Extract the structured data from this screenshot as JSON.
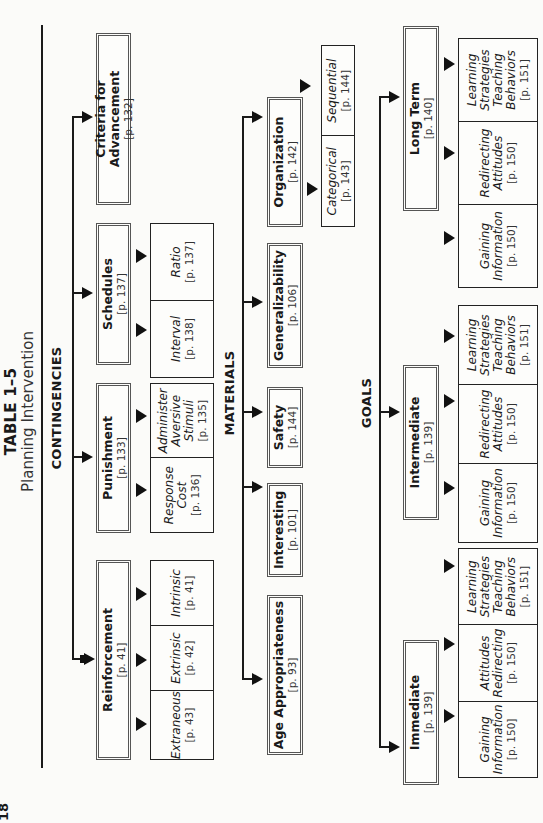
{
  "page_number": "18",
  "title": {
    "number": "TABLE 1–5",
    "subtitle": "Planning Intervention"
  },
  "sections": {
    "contingencies": {
      "heading": "CONTINGENCIES",
      "items": [
        {
          "label": "Reinforcement",
          "page": "[p. 41]",
          "subs": [
            {
              "label": "Intrinsic",
              "page": "[p. 41]"
            },
            {
              "label": "Extrinsic",
              "page": "[p. 42]"
            },
            {
              "label": "Extraneous",
              "page": "[p. 43]"
            }
          ]
        },
        {
          "label": "Punishment",
          "page": "[p. 133]",
          "subs": [
            {
              "label": "Administer Aversive Stimuli",
              "page": "[p. 135]"
            },
            {
              "label": "Response Cost",
              "page": "[p. 136]"
            }
          ]
        },
        {
          "label": "Schedules",
          "page": "[p. 137]",
          "subs": [
            {
              "label": "Ratio",
              "page": "[p. 137]"
            },
            {
              "label": "Interval",
              "page": "[p. 138]"
            }
          ]
        },
        {
          "label": "Criteria for Advancement",
          "page": "[p. 132]"
        }
      ]
    },
    "materials": {
      "heading": "MATERIALS",
      "items": [
        {
          "label": "Age Appropriateness",
          "page": "[p. 93]"
        },
        {
          "label": "Interesting",
          "page": "[p. 101]"
        },
        {
          "label": "Safety",
          "page": "[p. 144]"
        },
        {
          "label": "Generalizability",
          "page": "[p. 106]"
        },
        {
          "label": "Organization",
          "page": "[p. 142]",
          "subs": [
            {
              "label": "Categorical",
              "page": "[p. 143]"
            },
            {
              "label": "Sequential",
              "page": "[p. 144]"
            }
          ]
        }
      ]
    },
    "goals": {
      "heading": "GOALS",
      "items": [
        {
          "label": "Immediate",
          "page": "[p. 139]",
          "subs": [
            {
              "label": "Gaining Information",
              "page": "[p. 150]"
            },
            {
              "label": "Attitudes Redirecting",
              "page": "[p. 150]"
            },
            {
              "label": "Learning Strategies Teaching Behaviors",
              "page": "[p. 151]"
            }
          ]
        },
        {
          "label": "Intermediate",
          "page": "[p. 139]",
          "subs": [
            {
              "label": "Gaining Information",
              "page": "[p. 150]"
            },
            {
              "label": "Redirecting Attitudes",
              "page": "[p. 150]"
            },
            {
              "label": "Learning Strategies Teaching Behaviors",
              "page": "[p. 151]"
            }
          ]
        },
        {
          "label": "Long Term",
          "page": "[p. 140]",
          "subs": [
            {
              "label": "Gaining Information",
              "page": "[p. 150]"
            },
            {
              "label": "Redirecting Attitudes",
              "page": "[p. 150]"
            },
            {
              "label": "Learning Strategies Teaching Behaviors",
              "page": "[p. 151]"
            }
          ]
        }
      ]
    }
  }
}
